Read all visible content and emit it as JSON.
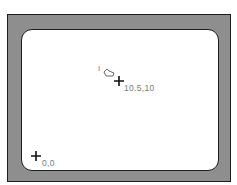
{
  "diagram": {
    "points": [
      {
        "name": "origin",
        "label": "0,0"
      },
      {
        "name": "pointer-position",
        "label": "10.5,10"
      }
    ],
    "cursor_icon": "pointing-hand-icon",
    "ibeam_glyph": "I",
    "colors": {
      "bezel": "#8e8e8e",
      "screen": "#ffffff",
      "border": "#1e1e1e",
      "label": "#7a7a7a"
    }
  }
}
